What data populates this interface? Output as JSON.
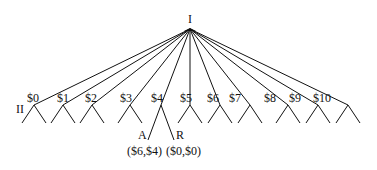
{
  "root": {
    "label": "I",
    "x": 190,
    "y": 27
  },
  "player2_label": {
    "text": "II",
    "x": 16,
    "y": 113
  },
  "offers": [
    {
      "label": "$0",
      "x": 34,
      "lx": 27,
      "ly": 102
    },
    {
      "label": "$1",
      "x": 63,
      "lx": 57,
      "ly": 102
    },
    {
      "label": "$2",
      "x": 92,
      "lx": 85,
      "ly": 102
    },
    {
      "label": "$3",
      "x": 130,
      "lx": 120,
      "ly": 102
    },
    {
      "label": "$4",
      "x": 161,
      "lx": 151,
      "ly": 102
    },
    {
      "label": "$5",
      "x": 190,
      "lx": 180,
      "ly": 102
    },
    {
      "label": "$6",
      "x": 220,
      "lx": 207,
      "ly": 102
    },
    {
      "label": "$7",
      "x": 250,
      "lx": 229,
      "ly": 102
    },
    {
      "label": "$8",
      "x": 288,
      "lx": 264,
      "ly": 102
    },
    {
      "label": "$9",
      "x": 318,
      "lx": 289,
      "ly": 102
    },
    {
      "label": "$10",
      "x": 348,
      "lx": 313,
      "ly": 102
    }
  ],
  "node_y": 105,
  "leaf_y": 123,
  "leaf_dx": 12,
  "expanded": {
    "offer_index": 4,
    "accept": {
      "label": "A",
      "x": 148,
      "y": 140,
      "lx": 138,
      "ly": 139,
      "payoff": "($6,$4)",
      "px": 127,
      "py": 155
    },
    "reject": {
      "label": "R",
      "x": 174,
      "y": 140,
      "lx": 176,
      "ly": 139,
      "payoff": "($0,$0)",
      "px": 166,
      "py": 155
    }
  }
}
